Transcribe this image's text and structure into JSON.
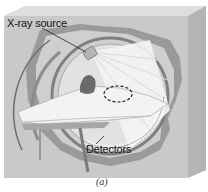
{
  "figure": {
    "labels": {
      "xray_source": "X-ray source",
      "detectors": "Detectors"
    },
    "caption": "(a)"
  },
  "colors": {
    "box_face": "#c9c9c9",
    "box_top": "#dcdcdc",
    "box_side": "#b8b8b8",
    "ring_dark": "#8a8a8a",
    "ring_light": "#e4e4e4",
    "patient": "#f2f2f2",
    "heart": "#6b6b6b",
    "beam": "#ececec"
  }
}
